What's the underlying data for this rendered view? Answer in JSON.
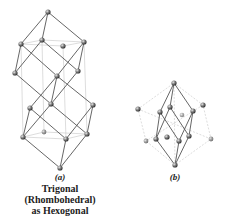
{
  "figure": {
    "panel_a": {
      "label": "(a)",
      "caption_lines": [
        "Trigonal",
        "(Rhombohedral)",
        "as Hexogonal"
      ]
    },
    "panel_b": {
      "label": "(b)"
    }
  },
  "colors": {
    "bond": "#555555",
    "guide": "#c8c8c8",
    "atom": "#666666",
    "atom_highlight": "#dddddd"
  }
}
